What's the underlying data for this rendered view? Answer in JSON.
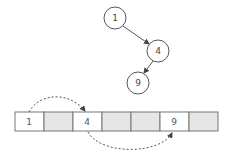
{
  "tree": {
    "nodes": [
      {
        "id": "n1",
        "label": "1",
        "cx": 115,
        "cy": 18,
        "r": 11
      },
      {
        "id": "n4",
        "label": "4",
        "cx": 158,
        "cy": 51,
        "r": 11
      },
      {
        "id": "n9",
        "label": "9",
        "cx": 138,
        "cy": 83,
        "r": 11
      }
    ],
    "edges": [
      {
        "from": "1",
        "to": "4"
      },
      {
        "from": "4",
        "to": "9"
      }
    ]
  },
  "array": {
    "cells": [
      {
        "index": 0,
        "label": "1",
        "filled": true
      },
      {
        "index": 1,
        "label": "",
        "filled": false
      },
      {
        "index": 2,
        "label": "4",
        "filled": true
      },
      {
        "index": 3,
        "label": "",
        "filled": false
      },
      {
        "index": 4,
        "label": "",
        "filled": false
      },
      {
        "index": 5,
        "label": "9",
        "filled": true
      },
      {
        "index": 6,
        "label": "",
        "filled": false
      }
    ],
    "links": [
      {
        "from_index": 0,
        "to_index": 2,
        "side": "top"
      },
      {
        "from_index": 2,
        "to_index": 5,
        "side": "bottom"
      }
    ]
  },
  "colors": {
    "stroke": "#555555",
    "empty_cell": "#e6e6e6",
    "filled_cell": "#ffffff"
  }
}
